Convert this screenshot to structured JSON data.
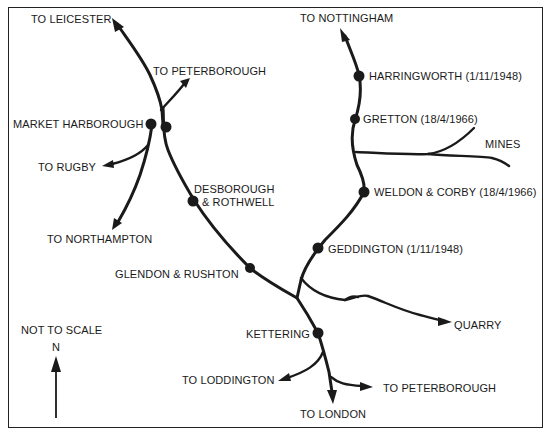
{
  "map": {
    "colors": {
      "line": "#1a1a1a",
      "background": "#ffffff",
      "border": "#222222"
    },
    "destinations": [
      {
        "id": "leicester",
        "label": "TO LEICESTER"
      },
      {
        "id": "peterborough-north",
        "label": "TO PETERBOROUGH"
      },
      {
        "id": "rugby",
        "label": "TO RUGBY"
      },
      {
        "id": "northampton",
        "label": "TO NORTHAMPTON"
      },
      {
        "id": "nottingham",
        "label": "TO NOTTINGHAM"
      },
      {
        "id": "loddington",
        "label": "TO LODDINGTON"
      },
      {
        "id": "peterborough-south",
        "label": "TO PETERBOROUGH"
      },
      {
        "id": "london",
        "label": "TO LONDON"
      }
    ],
    "stations": [
      {
        "id": "market-harborough",
        "label": "MARKET HARBOROUGH"
      },
      {
        "id": "desborough",
        "label": "DESBOROUGH",
        "label2": "& ROTHWELL"
      },
      {
        "id": "glendon",
        "label": "GLENDON & RUSHTON"
      },
      {
        "id": "kettering",
        "label": "KETTERING"
      },
      {
        "id": "harringworth",
        "label": "HARRINGWORTH (1/11/1948)"
      },
      {
        "id": "gretton",
        "label": "GRETTON (18/4/1966)"
      },
      {
        "id": "weldon",
        "label": "WELDON & CORBY (18/4/1966)"
      },
      {
        "id": "geddington",
        "label": "GEDDINGTON (1/11/1948)"
      }
    ],
    "features": [
      {
        "id": "mines",
        "label": "MINES"
      },
      {
        "id": "quarry",
        "label": "QUARRY"
      }
    ],
    "legend": {
      "scale_note": "NOT TO SCALE",
      "north": "N"
    }
  }
}
